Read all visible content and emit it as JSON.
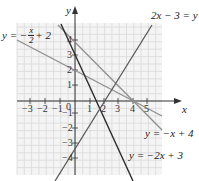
{
  "chart_data": {
    "type": "line",
    "title": "",
    "xlabel": "x",
    "ylabel": "y",
    "xlim": [
      -4,
      6
    ],
    "ylim": [
      -5,
      5.3
    ],
    "grid": true,
    "x_ticks": [
      "-3",
      "-2",
      "-1",
      "0",
      "1",
      "2",
      "3",
      "4",
      "5"
    ],
    "y_ticks": [
      "4",
      "3",
      "2",
      "1",
      "-1",
      "-2",
      "-3",
      "-4"
    ],
    "series": [
      {
        "name": "y = -x/2 + 2",
        "slope": -0.5,
        "intercept": 2,
        "color": "#8a8a8a"
      },
      {
        "name": "y = -x + 4",
        "slope": -1,
        "intercept": 4,
        "color": "#8a8a8a"
      },
      {
        "name": "y = -2x + 3",
        "slope": -2,
        "intercept": 3,
        "color": "#2b2b2b"
      },
      {
        "name": "2x - 3 = y",
        "slope": 2,
        "intercept": -3,
        "color": "#555555"
      }
    ]
  },
  "axes": {
    "x_label": "x",
    "y_label": "y",
    "origin_label": "0",
    "x_ticks": [
      {
        "label": "−3",
        "px": 30
      },
      {
        "label": "−2",
        "px": 45
      },
      {
        "label": "−1",
        "px": 60
      },
      {
        "label": "1",
        "px": 90
      },
      {
        "label": "2",
        "px": 104
      },
      {
        "label": "3",
        "px": 118
      },
      {
        "label": "4",
        "px": 133
      },
      {
        "label": "5",
        "px": 147
      }
    ],
    "y_ticks": [
      {
        "label": "4",
        "px": 40
      },
      {
        "label": "3",
        "px": 55
      },
      {
        "label": "2",
        "px": 70
      },
      {
        "label": "1",
        "px": 85
      },
      {
        "label": "−1",
        "px": 113
      },
      {
        "label": "−2",
        "px": 128
      },
      {
        "label": "−3",
        "px": 143
      },
      {
        "label": "−4",
        "px": 158
      }
    ]
  },
  "labels": {
    "line1": {
      "prefix": "y = −",
      "num": "x",
      "den": "2",
      "suffix": "+ 2"
    },
    "line2": "y = −x + 4",
    "line3": "y = −2x + 3",
    "line4": "2x − 3 = y"
  }
}
